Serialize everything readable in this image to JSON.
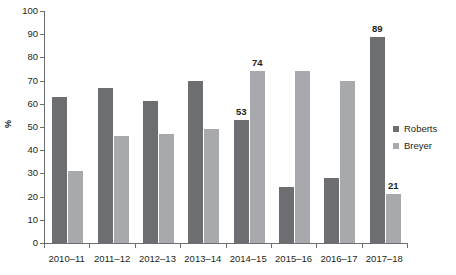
{
  "chart_data": {
    "type": "bar",
    "title": "",
    "subtitle": "",
    "xlabel": "",
    "ylabel": "%",
    "ylim": [
      0,
      100
    ],
    "ytick_step": 10,
    "yticks": [
      0,
      10,
      20,
      30,
      40,
      50,
      60,
      70,
      80,
      90,
      100
    ],
    "ytick_labels": [
      "0",
      "10",
      "20",
      "30",
      "40",
      "50",
      "60",
      "70",
      "80",
      "90",
      "100"
    ],
    "grid": false,
    "legend_position": "right",
    "categories": [
      "2010–11",
      "2011–12",
      "2012–13",
      "2013–14",
      "2014–15",
      "2015–16",
      "2016–17",
      "2017–18"
    ],
    "series": [
      {
        "name": "Roberts",
        "color": "#6d6e71",
        "values": [
          63,
          67,
          61,
          70,
          53,
          24,
          28,
          89
        ],
        "data_labels": [
          null,
          null,
          null,
          null,
          "53",
          null,
          null,
          "89"
        ]
      },
      {
        "name": "Breyer",
        "color": "#a7a9ac",
        "values": [
          31,
          46,
          47,
          49,
          74,
          74,
          70,
          21
        ],
        "data_labels": [
          null,
          null,
          null,
          null,
          "74",
          null,
          null,
          "21"
        ]
      }
    ],
    "annotations": [
      {
        "label": "53",
        "category": "2014–15",
        "series": "Roberts",
        "value": 53
      },
      {
        "label": "74",
        "category": "2014–15",
        "series": "Breyer",
        "value": 74
      },
      {
        "label": "89",
        "category": "2017–18",
        "series": "Roberts",
        "value": 89
      },
      {
        "label": "21",
        "category": "2017–18",
        "series": "Breyer",
        "value": 21
      }
    ]
  },
  "legend": {
    "items": [
      {
        "label": "Roberts",
        "color": "#6d6e71"
      },
      {
        "label": "Breyer",
        "color": "#a7a9ac"
      }
    ]
  },
  "colors": {
    "roberts": "#6d6e71",
    "breyer": "#a7a9ac",
    "axis": "#6d6e71",
    "text": "#231f20",
    "background": "#ffffff"
  }
}
